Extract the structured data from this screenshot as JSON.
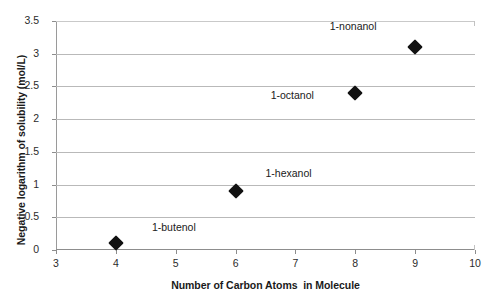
{
  "chart_data": {
    "type": "scatter",
    "title": "",
    "xlabel": "Number of Carbon Atoms  in Molecule",
    "ylabel": "Negative logarithm of solubility (mol/L)",
    "xlim": [
      3,
      10
    ],
    "ylim": [
      0,
      3.5
    ],
    "grid": true,
    "legend": "none",
    "xticks": [
      "3",
      "4",
      "5",
      "6",
      "7",
      "8",
      "9",
      "10"
    ],
    "xtick_values": [
      3,
      4,
      5,
      6,
      7,
      8,
      9,
      10
    ],
    "yticks": [
      "0",
      "0.5",
      "1",
      "1.5",
      "2",
      "2.5",
      "3",
      "3.5"
    ],
    "ytick_values": [
      0,
      0.5,
      1,
      1.5,
      2,
      2.5,
      3,
      3.5
    ],
    "points": [
      {
        "label": "1-butenol",
        "x": 4,
        "y": 0.1,
        "label_dx": 58,
        "label_dy": -16
      },
      {
        "label": "1-hexanol",
        "x": 6,
        "y": 0.9,
        "label_dx": 53,
        "label_dy": -18
      },
      {
        "label": "1-octanol",
        "x": 8,
        "y": 2.4,
        "label_dx": -63,
        "label_dy": 2
      },
      {
        "label": "1-nonanol",
        "x": 9,
        "y": 3.1,
        "label_dx": -62,
        "label_dy": -21
      }
    ],
    "marker_shape": "diamond",
    "marker_color": "#111111",
    "gridline_color": "#b9b9b9",
    "axis_color": "#8d8d8d",
    "background_color": "#ffffff"
  }
}
